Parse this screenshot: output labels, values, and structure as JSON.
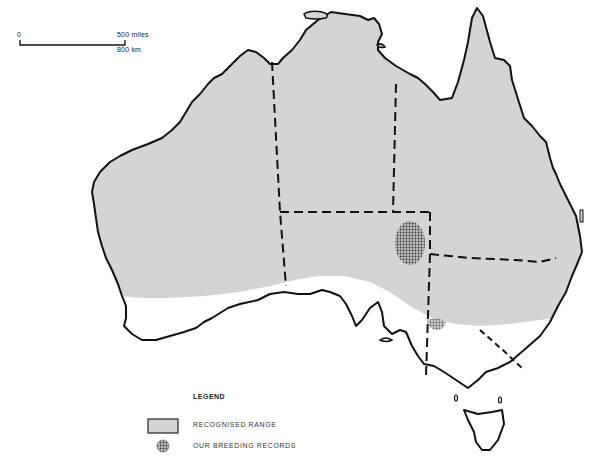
{
  "map": {
    "subject": "Australia species distribution map",
    "colors": {
      "range_fill": "#d4d4d4",
      "coastline": "#111111",
      "breeding_dot": "#555555",
      "background": "#ffffff"
    }
  },
  "scale_bar": {
    "start_label": "0",
    "end_label_miles": "500 miles",
    "end_label_km": "800 km"
  },
  "legend": {
    "title": "LEGEND",
    "items": [
      {
        "swatch": "grey-box",
        "label": "RECOGNISED RANGE"
      },
      {
        "swatch": "stippled-circle",
        "label": "OUR BREEDING RECORDS"
      }
    ]
  }
}
